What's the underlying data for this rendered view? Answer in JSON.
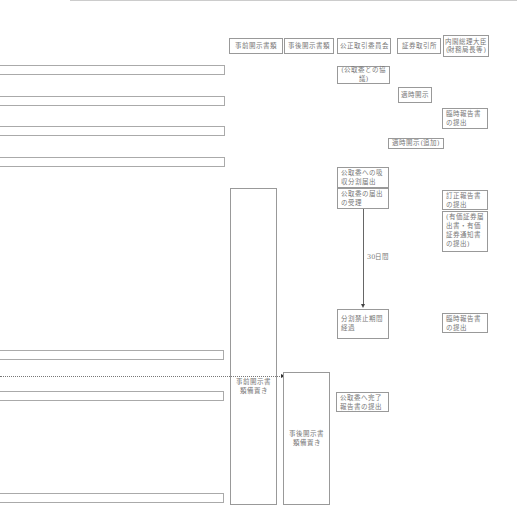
{
  "headers": [
    {
      "id": "pre-disclosure",
      "label": "事前開示書類"
    },
    {
      "id": "post-disclosure",
      "label": "事後開示書類"
    },
    {
      "id": "ftc",
      "label": "公正取引委員会"
    },
    {
      "id": "exchange",
      "label": "証券取引所"
    },
    {
      "id": "pm",
      "label": "内閣総理大臣\n(財務局長等)"
    }
  ],
  "ftc_column": {
    "consultation": "(公取委との協議)",
    "pre_notification": "公取委への吸収分割届出",
    "notification_accepted": "公取委の届出の受理",
    "period_label": "30日間",
    "prohibition_end": "分割禁止期間経過",
    "completion_report": "公取委へ完了報告書の提出"
  },
  "exchange_column": {
    "timely_disclosure": "適時開示",
    "timely_disclosure_additional": "適時開示(追加)"
  },
  "pm_column": {
    "extraordinary_report_1": "臨時報告書の提出",
    "amended_report": "訂正報告書の提出",
    "securities_note": "(有価証券届出書・有価証券通知書の提出)",
    "extraordinary_report_2": "臨時報告書の提出"
  },
  "pre_column": {
    "keep_label": "事前開示書類備置き"
  },
  "post_column": {
    "keep_label": "事後開示書類備置き"
  }
}
